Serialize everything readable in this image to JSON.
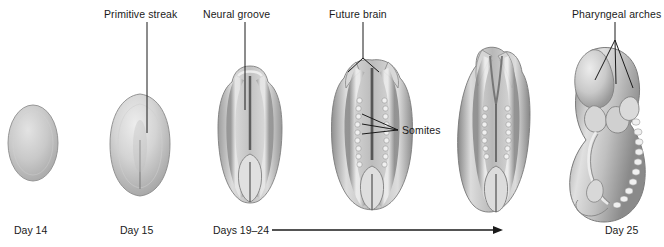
{
  "figure": {
    "background_color": "#ffffff",
    "ink_color": "#1a1a1a"
  },
  "callouts": [
    {
      "id": "primitive-streak",
      "label": "Primitive streak",
      "x": 104,
      "y": 8
    },
    {
      "id": "neural-groove",
      "label": "Neural groove",
      "x": 203,
      "y": 8
    },
    {
      "id": "future-brain",
      "label": "Future brain",
      "x": 329,
      "y": 8
    },
    {
      "id": "pharyngeal-arches",
      "label": "Pharyngeal arches",
      "x": 572,
      "y": 8
    },
    {
      "id": "somites",
      "label": "Somites",
      "x": 402,
      "y": 124
    }
  ],
  "timeline": {
    "days": [
      {
        "id": "day-14",
        "label": "Day 14",
        "x": 14,
        "y": 224
      },
      {
        "id": "day-15",
        "label": "Day 15",
        "x": 120,
        "y": 224
      },
      {
        "id": "days-19-24",
        "label": "Days 19–24",
        "x": 213,
        "y": 224
      },
      {
        "id": "day-25",
        "label": "Day 25",
        "x": 605,
        "y": 224
      }
    ],
    "arrow": {
      "from_x": 272,
      "to_x": 503,
      "y": 230
    }
  },
  "stages": [
    {
      "id": "stage-day-14",
      "name": "blastodisc-oval",
      "day": "Day 14"
    },
    {
      "id": "stage-day-15",
      "name": "primitive-streak-disc",
      "day": "Day 15"
    },
    {
      "id": "stage-day-19",
      "name": "neural-groove-embryo",
      "day": "Days 19–24"
    },
    {
      "id": "stage-day-21",
      "name": "neural-fold-somite-embryo",
      "day": "Days 19–24"
    },
    {
      "id": "stage-day-23",
      "name": "closing-neural-tube-embryo",
      "day": "Days 19–24"
    },
    {
      "id": "stage-day-25",
      "name": "curved-embryo",
      "day": "Day 25"
    }
  ]
}
